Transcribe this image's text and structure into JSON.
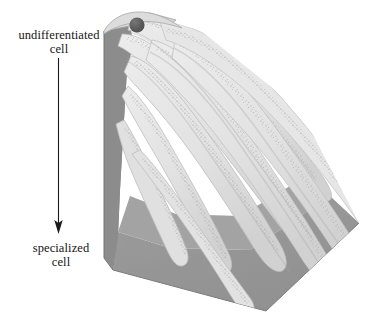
{
  "figure": {
    "background_color": "#ffffff"
  },
  "labels": {
    "top": {
      "line1": "undifferentiated",
      "line2": "cell",
      "x": 59,
      "y": 35
    },
    "bottom": {
      "line1": "specialized",
      "line2": "cell",
      "x": 59,
      "y": 248
    }
  },
  "arrow": {
    "name": "differentiation-arrow",
    "direction": "down",
    "x": 58.5,
    "y_start": 58,
    "y_end": 233,
    "color": "#1a1a1a",
    "stroke_width": 1.1
  },
  "cell_marker": {
    "name": "undifferentiated-cell-dot",
    "cx": 137,
    "cy": 25,
    "r": 7.5,
    "color": "#585858",
    "highlight_color": "#6d6d6d"
  },
  "block": {
    "name": "tissue-block",
    "left_face_color": "#8e8e8e",
    "front_face_color": "#9a9a9a",
    "top_face_color": "#d8d8d8",
    "edge_color": "#6f6f6f",
    "vertices": {
      "top_left": [
        104,
        30
      ],
      "top_apex": [
        140,
        14
      ],
      "bottom_left": [
        113,
        270
      ],
      "bottom_vertex": [
        266,
        311
      ],
      "right_corner": [
        359,
        223
      ]
    }
  },
  "ridges": {
    "name": "differentiation-ridges",
    "count": 9,
    "fill_color": "#e4e4e4",
    "shade_color": "#cfcfcf",
    "stipple_color": "#a8a8a8",
    "outline_color": "#b4b4b4",
    "description": "Fan of elongated tapering ridges radiating from the undifferentiated cell toward the lower-right margin"
  },
  "colors": {
    "ink": "#141414",
    "mid_gray": "#8e8e8e",
    "light_gray": "#e4e4e4",
    "dark_dot": "#585858"
  }
}
